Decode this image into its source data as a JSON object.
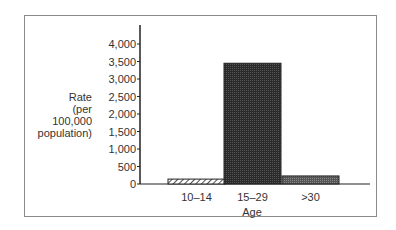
{
  "chart_data": {
    "type": "bar",
    "title": "",
    "xlabel": "Age",
    "ylabel": "Rate (per 100,000 population)",
    "ylabel_lines": [
      "Rate",
      "(per 100,000",
      "population)"
    ],
    "categories": [
      "10–14",
      "15–29",
      ">30"
    ],
    "values": [
      140,
      3450,
      230
    ],
    "bar_patterns": [
      "diagonal-hatch",
      "dark-stipple",
      "gray-stipple"
    ],
    "yticks": [
      0,
      500,
      1000,
      1500,
      2000,
      2500,
      3000,
      3500,
      4000
    ],
    "ytick_labels": [
      "0",
      "500",
      "1,000",
      "1,500",
      "2,000",
      "2,500",
      "3,000",
      "3,500",
      "4,000"
    ],
    "ylim": [
      0,
      4000
    ],
    "grid": false,
    "legend": null
  }
}
